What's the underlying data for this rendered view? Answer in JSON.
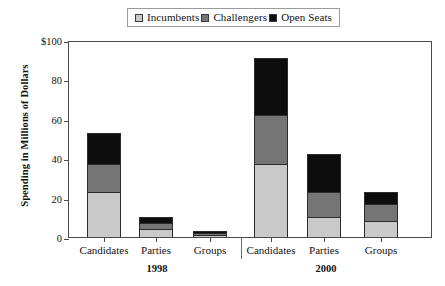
{
  "legend": {
    "entries": [
      {
        "label": "Incumbents",
        "color": "#c9c9c9"
      },
      {
        "label": "Challengers",
        "color": "#757575"
      },
      {
        "label": "Open Seats",
        "color": "#0d0d0d"
      }
    ]
  },
  "axis": {
    "y_title": "Spending in Millions of Dollars",
    "y_ticks": [
      "$100",
      "80",
      "60",
      "40",
      "20",
      "0"
    ]
  },
  "groups": [
    {
      "label": "1998"
    },
    {
      "label": "2000"
    }
  ],
  "chart_data": {
    "type": "bar",
    "title": "",
    "xlabel": "",
    "ylabel": "Spending in Millions of Dollars",
    "ylim": [
      0,
      100
    ],
    "ytick_values": [
      0,
      20,
      40,
      60,
      80,
      100
    ],
    "grid": false,
    "stacked": true,
    "legend_position": "top",
    "categories": [
      "1998 Candidates",
      "1998 Parties",
      "1998 Groups",
      "2000 Candidates",
      "2000 Parties",
      "2000 Groups"
    ],
    "category_labels": [
      "Candidates",
      "Parties",
      "Groups",
      "Candidates",
      "Parties",
      "Groups"
    ],
    "group_labels": [
      "1998",
      "1998",
      "1998",
      "2000",
      "2000",
      "2000"
    ],
    "series": [
      {
        "name": "Incumbents",
        "values": [
          23,
          4,
          1,
          37,
          10,
          8
        ]
      },
      {
        "name": "Challengers",
        "values": [
          14,
          3,
          1,
          25,
          13,
          9
        ]
      },
      {
        "name": "Open Seats",
        "values": [
          16,
          3,
          1,
          29,
          19,
          6
        ]
      }
    ],
    "totals": [
      53,
      10,
      3,
      91,
      42,
      23
    ]
  }
}
